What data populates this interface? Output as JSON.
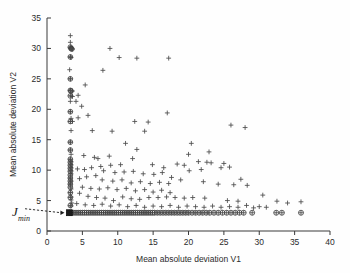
{
  "figure": {
    "background_color": "#fefefe",
    "width": 350,
    "height": 273
  },
  "chart_data": {
    "type": "scatter",
    "title": "",
    "xlabel": "Mean absolute deviation V1",
    "ylabel": "Mean absolute deviation V2",
    "xlim": [
      0,
      40
    ],
    "ylim": [
      0,
      35
    ],
    "xticks": [
      0,
      5,
      10,
      15,
      20,
      25,
      30,
      35,
      40
    ],
    "yticks": [
      0,
      5,
      10,
      15,
      20,
      25,
      30,
      35
    ],
    "xtick_labels": [
      "0",
      "5",
      "10",
      "15",
      "20",
      "25",
      "30",
      "35",
      "40"
    ],
    "ytick_labels": [
      "0",
      "5",
      "10",
      "15",
      "20",
      "25",
      "30",
      "35"
    ],
    "grid": false,
    "legend": "none",
    "marker_colors": {
      "plus": "#4a4a4a",
      "circle": "#3d3d3d",
      "highlight_square": "#1a1a1a"
    },
    "annotations": [
      {
        "text": "J",
        "subscript": "min",
        "style": "italic-serif",
        "arrow": "dashed",
        "points_to": [
          3.1,
          3.0
        ],
        "label_at": [
          1.0,
          2.0
        ]
      }
    ],
    "series": [
      {
        "name": "plus-markers",
        "marker": "plus",
        "points": [
          [
            3.3,
            32.1
          ],
          [
            3.3,
            31.0
          ],
          [
            3.4,
            30.2
          ],
          [
            3.5,
            30.0
          ],
          [
            3.6,
            29.9
          ],
          [
            3.3,
            28.6
          ],
          [
            3.4,
            28.5
          ],
          [
            3.2,
            26.5
          ],
          [
            3.3,
            25.0
          ],
          [
            3.3,
            23.1
          ],
          [
            3.6,
            23.0
          ],
          [
            3.4,
            22.2
          ],
          [
            3.6,
            22.1
          ],
          [
            3.3,
            21.3
          ],
          [
            3.3,
            19.6
          ],
          [
            3.4,
            18.5
          ],
          [
            3.3,
            18.0
          ],
          [
            3.6,
            18.0
          ],
          [
            3.4,
            16.5
          ],
          [
            3.3,
            14.6
          ],
          [
            3.3,
            13.3
          ],
          [
            3.4,
            12.6
          ],
          [
            3.3,
            11.8
          ],
          [
            3.4,
            11.4
          ],
          [
            3.4,
            10.9
          ],
          [
            3.4,
            10.4
          ],
          [
            3.4,
            9.9
          ],
          [
            3.4,
            9.4
          ],
          [
            3.3,
            8.7
          ],
          [
            3.4,
            8.2
          ],
          [
            3.3,
            7.7
          ],
          [
            3.4,
            6.9
          ],
          [
            3.3,
            6.3
          ],
          [
            3.4,
            5.6
          ],
          [
            3.4,
            5.1
          ],
          [
            3.5,
            4.6
          ],
          [
            3.4,
            4.1
          ],
          [
            8.9,
            30.0
          ],
          [
            10.2,
            28.5
          ],
          [
            12.7,
            28.4
          ],
          [
            17.2,
            28.4
          ],
          [
            7.9,
            26.4
          ],
          [
            5.4,
            24.0
          ],
          [
            4.4,
            22.3
          ],
          [
            4.1,
            21.3
          ],
          [
            4.9,
            20.5
          ],
          [
            5.8,
            19.0
          ],
          [
            4.4,
            18.6
          ],
          [
            12.4,
            18.0
          ],
          [
            14.3,
            17.9
          ],
          [
            17.0,
            19.4
          ],
          [
            26.0,
            17.4
          ],
          [
            28.0,
            17.0
          ],
          [
            6.4,
            16.5
          ],
          [
            9.2,
            16.4
          ],
          [
            13.8,
            16.4
          ],
          [
            20.4,
            14.4
          ],
          [
            11.1,
            14.4
          ],
          [
            22.9,
            13.0
          ],
          [
            12.7,
            13.4
          ],
          [
            5.2,
            12.4
          ],
          [
            6.7,
            12.1
          ],
          [
            7.2,
            11.9
          ],
          [
            8.8,
            12.3
          ],
          [
            12.1,
            11.9
          ],
          [
            20.0,
            12.6
          ],
          [
            21.4,
            11.4
          ],
          [
            22.6,
            11.3
          ],
          [
            23.2,
            11.2
          ],
          [
            25.0,
            11.1
          ],
          [
            18.4,
            11.0
          ],
          [
            19.4,
            10.8
          ],
          [
            14.9,
            10.9
          ],
          [
            16.5,
            10.4
          ],
          [
            10.4,
            10.9
          ],
          [
            9.0,
            10.8
          ],
          [
            7.6,
            10.6
          ],
          [
            6.3,
            10.4
          ],
          [
            5.3,
            10.1
          ],
          [
            4.3,
            10.2
          ],
          [
            24.6,
            10.4
          ],
          [
            25.8,
            10.5
          ],
          [
            8.0,
            9.9
          ],
          [
            9.6,
            9.6
          ],
          [
            10.9,
            9.7
          ],
          [
            12.2,
            9.8
          ],
          [
            13.6,
            9.4
          ],
          [
            15.1,
            9.3
          ],
          [
            16.3,
            9.6
          ],
          [
            17.6,
            8.8
          ],
          [
            18.9,
            8.4
          ],
          [
            20.1,
            9.9
          ],
          [
            21.8,
            10.1
          ],
          [
            6.9,
            9.1
          ],
          [
            5.6,
            8.9
          ],
          [
            4.6,
            8.6
          ],
          [
            7.8,
            8.4
          ],
          [
            9.3,
            8.2
          ],
          [
            10.6,
            8.4
          ],
          [
            11.9,
            7.9
          ],
          [
            13.2,
            8.1
          ],
          [
            14.6,
            7.8
          ],
          [
            15.9,
            8.0
          ],
          [
            17.2,
            7.8
          ],
          [
            22.1,
            8.1
          ],
          [
            24.2,
            7.7
          ],
          [
            26.4,
            7.6
          ],
          [
            27.4,
            8.5
          ],
          [
            28.3,
            7.5
          ],
          [
            5.0,
            7.2
          ],
          [
            6.2,
            7.0
          ],
          [
            7.4,
            6.9
          ],
          [
            8.6,
            7.1
          ],
          [
            9.9,
            6.8
          ],
          [
            11.2,
            7.0
          ],
          [
            12.5,
            6.6
          ],
          [
            13.8,
            6.8
          ],
          [
            15.0,
            6.4
          ],
          [
            16.2,
            6.7
          ],
          [
            17.4,
            6.3
          ],
          [
            4.6,
            6.2
          ],
          [
            5.8,
            5.7
          ],
          [
            7.0,
            5.5
          ],
          [
            8.2,
            5.4
          ],
          [
            9.4,
            5.0
          ],
          [
            10.7,
            5.6
          ],
          [
            11.9,
            5.3
          ],
          [
            13.1,
            5.2
          ],
          [
            14.4,
            5.5
          ],
          [
            15.7,
            5.5
          ],
          [
            16.9,
            5.6
          ],
          [
            18.1,
            5.5
          ],
          [
            19.4,
            5.4
          ],
          [
            20.6,
            5.5
          ],
          [
            22.3,
            5.4
          ],
          [
            25.5,
            5.0
          ],
          [
            27.0,
            4.9
          ],
          [
            30.5,
            5.9
          ],
          [
            32.5,
            4.9
          ],
          [
            34.0,
            4.6
          ],
          [
            35.9,
            4.8
          ],
          [
            4.2,
            4.5
          ],
          [
            5.4,
            4.3
          ],
          [
            6.6,
            4.2
          ],
          [
            7.8,
            4.4
          ],
          [
            9.0,
            4.1
          ],
          [
            10.2,
            4.3
          ],
          [
            11.4,
            4.0
          ],
          [
            12.6,
            4.2
          ],
          [
            13.8,
            3.9
          ],
          [
            15.0,
            4.1
          ],
          [
            16.2,
            4.0
          ],
          [
            17.4,
            4.2
          ],
          [
            18.6,
            3.9
          ],
          [
            19.8,
            4.1
          ],
          [
            21.0,
            4.0
          ],
          [
            22.2,
            3.9
          ],
          [
            23.4,
            4.1
          ],
          [
            24.6,
            3.9
          ],
          [
            25.8,
            4.0
          ],
          [
            27.0,
            3.9
          ],
          [
            28.2,
            4.2
          ],
          [
            29.2,
            3.8
          ],
          [
            30.0,
            4.0
          ],
          [
            31.0,
            3.9
          ]
        ]
      },
      {
        "name": "circled-markers",
        "marker": "circle-plus",
        "points": [
          [
            3.3,
            30.2
          ],
          [
            3.4,
            30.0
          ],
          [
            3.5,
            29.9
          ],
          [
            3.3,
            28.6
          ],
          [
            3.3,
            25.0
          ],
          [
            3.3,
            23.1
          ],
          [
            3.4,
            23.0
          ],
          [
            3.3,
            22.2
          ],
          [
            3.3,
            19.6
          ],
          [
            3.3,
            18.0
          ],
          [
            3.3,
            14.6
          ],
          [
            3.3,
            13.3
          ],
          [
            3.3,
            11.8
          ],
          [
            3.3,
            11.3
          ],
          [
            3.3,
            10.8
          ],
          [
            3.3,
            10.3
          ],
          [
            3.3,
            9.8
          ],
          [
            3.3,
            9.2
          ],
          [
            3.3,
            8.7
          ],
          [
            3.3,
            8.2
          ],
          [
            3.3,
            7.7
          ],
          [
            3.3,
            7.2
          ],
          [
            3.3,
            6.3
          ],
          [
            3.3,
            5.5
          ],
          [
            3.3,
            4.2
          ]
        ]
      },
      {
        "name": "baseline-band",
        "marker": "circle-plus",
        "description": "dense horizontal band of solutions at minimum V2",
        "y_value": 3.0,
        "x_values": [
          3.2,
          3.5,
          3.8,
          4.1,
          4.4,
          4.7,
          5.0,
          5.3,
          5.6,
          5.9,
          6.2,
          6.5,
          6.8,
          7.1,
          7.4,
          7.7,
          8.0,
          8.3,
          8.6,
          8.9,
          9.2,
          9.5,
          9.8,
          10.1,
          10.4,
          10.7,
          11.0,
          11.3,
          11.6,
          11.9,
          12.2,
          12.5,
          12.8,
          13.1,
          13.4,
          13.7,
          14.0,
          14.3,
          14.6,
          14.9,
          15.2,
          15.6,
          16.0,
          16.4,
          16.8,
          17.2,
          17.6,
          18.0,
          18.4,
          18.8,
          19.2,
          19.6,
          20.0,
          20.5,
          21.0,
          21.5,
          22.0,
          22.5,
          23.0,
          23.6,
          24.2,
          24.8,
          25.4,
          26.0,
          26.6,
          27.2,
          27.8,
          29.0,
          32.4,
          33.2,
          35.9
        ]
      },
      {
        "name": "minimum-point",
        "marker": "filled-square",
        "points": [
          [
            3.15,
            3.0
          ]
        ]
      }
    ]
  }
}
